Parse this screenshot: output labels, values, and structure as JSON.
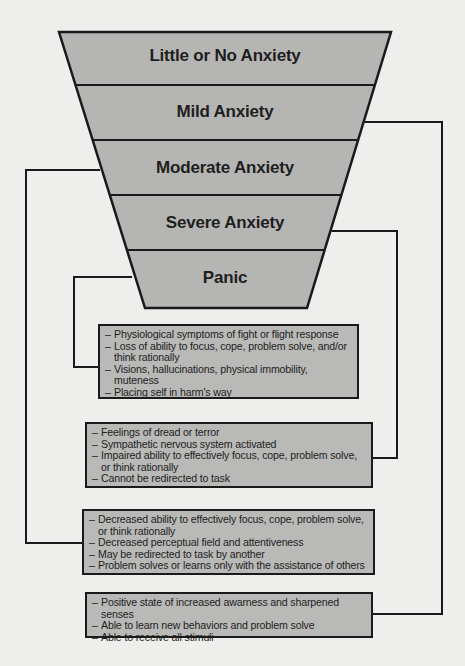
{
  "colors": {
    "background": "#eeeeec",
    "funnel_fill": "#b5b5b3",
    "box_fill": "#b9b9b7",
    "line": "#1a1a1a"
  },
  "funnel": {
    "levels": [
      {
        "label": "Little or No Anxiety"
      },
      {
        "label": "Mild Anxiety"
      },
      {
        "label": "Moderate Anxiety"
      },
      {
        "label": "Severe Anxiety"
      },
      {
        "label": "Panic"
      }
    ]
  },
  "boxes": {
    "panic": {
      "items": [
        "Physiological symptoms of fight or flight response",
        "Loss of ability to focus, cope, problem solve, and/or think rationally",
        "Visions, hallucinations, physical immobility, muteness",
        "Placing self in harm's way"
      ]
    },
    "severe": {
      "items": [
        "Feelings of dread or terror",
        "Sympathetic nervous system activated",
        "Impaired ability to effectively focus, cope, problem solve, or think rationally",
        "Cannot be redirected to task"
      ]
    },
    "moderate": {
      "items": [
        "Decreased ability to effectively focus, cope, problem solve, or think rationally",
        "Decreased perceptual field and attentiveness",
        "May be redirected to task by another",
        "Problem solves or learns only with the assistance of others"
      ]
    },
    "mild": {
      "items": [
        "Positive state of increased awarness and sharpened senses",
        "Able to learn new behaviors and problem solve",
        "Able to receive all stimuli"
      ]
    }
  }
}
